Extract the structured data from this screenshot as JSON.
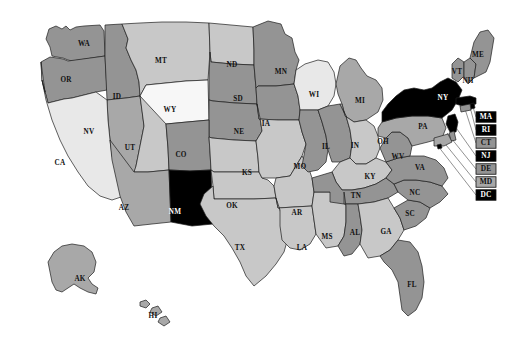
{
  "map": {
    "title": "United States choropleth map",
    "projection_note": "Albers-style USA with Alaska and Hawaii insets",
    "background_color": "#ffffff",
    "border_color": "#1c1c1c",
    "shades": {
      "level_0": "#f7f7f7",
      "level_1": "#e8e8e8",
      "level_2": "#d0d0d0",
      "level_3": "#c8c8c8",
      "level_4": "#a8a8a8",
      "level_5": "#949494",
      "level_6": "#000000"
    },
    "states": [
      {
        "code": "WA",
        "shade": "#949494",
        "label_x": 84,
        "label_y": 44,
        "dark_text": false
      },
      {
        "code": "OR",
        "shade": "#949494",
        "label_x": 66,
        "label_y": 80,
        "dark_text": false
      },
      {
        "code": "ID",
        "shade": "#949494",
        "label_x": 117,
        "label_y": 97,
        "dark_text": false
      },
      {
        "code": "MT",
        "shade": "#c8c8c8",
        "label_x": 161,
        "label_y": 61,
        "dark_text": false
      },
      {
        "code": "WY",
        "shade": "#f7f7f7",
        "label_x": 170,
        "label_y": 110,
        "dark_text": false
      },
      {
        "code": "ND",
        "shade": "#c8c8c8",
        "label_x": 232,
        "label_y": 65,
        "dark_text": false
      },
      {
        "code": "SD",
        "shade": "#949494",
        "label_x": 238,
        "label_y": 99,
        "dark_text": false
      },
      {
        "code": "NE",
        "shade": "#949494",
        "label_x": 239,
        "label_y": 132,
        "dark_text": false
      },
      {
        "code": "MN",
        "shade": "#949494",
        "label_x": 281,
        "label_y": 72,
        "dark_text": false
      },
      {
        "code": "IA",
        "shade": "#949494",
        "label_x": 266,
        "label_y": 124,
        "dark_text": false
      },
      {
        "code": "WI",
        "shade": "#e8e8e8",
        "label_x": 314,
        "label_y": 95,
        "dark_text": false
      },
      {
        "code": "MI",
        "shade": "#a8a8a8",
        "label_x": 360,
        "label_y": 101,
        "dark_text": false
      },
      {
        "code": "NV",
        "shade": "#a8a8a8",
        "label_x": 89,
        "label_y": 132,
        "dark_text": false
      },
      {
        "code": "UT",
        "shade": "#c8c8c8",
        "label_x": 130,
        "label_y": 148,
        "dark_text": false
      },
      {
        "code": "CO",
        "shade": "#949494",
        "label_x": 181,
        "label_y": 155,
        "dark_text": false
      },
      {
        "code": "CA",
        "shade": "#e8e8e8",
        "label_x": 60,
        "label_y": 163,
        "dark_text": false
      },
      {
        "code": "AZ",
        "shade": "#a8a8a8",
        "label_x": 124,
        "label_y": 208,
        "dark_text": false
      },
      {
        "code": "NM",
        "shade": "#000000",
        "label_x": 175,
        "label_y": 212,
        "dark_text": true
      },
      {
        "code": "KS",
        "shade": "#c8c8c8",
        "label_x": 247,
        "label_y": 173,
        "dark_text": false
      },
      {
        "code": "OK",
        "shade": "#c8c8c8",
        "label_x": 232,
        "label_y": 206,
        "dark_text": false
      },
      {
        "code": "TX",
        "shade": "#c8c8c8",
        "label_x": 240,
        "label_y": 248,
        "dark_text": false
      },
      {
        "code": "MO",
        "shade": "#c8c8c8",
        "label_x": 300,
        "label_y": 167,
        "dark_text": false
      },
      {
        "code": "AR",
        "shade": "#c8c8c8",
        "label_x": 297,
        "label_y": 213,
        "dark_text": false
      },
      {
        "code": "LA",
        "shade": "#c8c8c8",
        "label_x": 302,
        "label_y": 248,
        "dark_text": false
      },
      {
        "code": "MS",
        "shade": "#c8c8c8",
        "label_x": 327,
        "label_y": 237,
        "dark_text": false
      },
      {
        "code": "IL",
        "shade": "#949494",
        "label_x": 326,
        "label_y": 147,
        "dark_text": false
      },
      {
        "code": "IN",
        "shade": "#949494",
        "label_x": 355,
        "label_y": 146,
        "dark_text": false
      },
      {
        "code": "OH",
        "shade": "#c8c8c8",
        "label_x": 383,
        "label_y": 142,
        "dark_text": false
      },
      {
        "code": "KY",
        "shade": "#c8c8c8",
        "label_x": 370,
        "label_y": 177,
        "dark_text": false
      },
      {
        "code": "TN",
        "shade": "#949494",
        "label_x": 356,
        "label_y": 196,
        "dark_text": false
      },
      {
        "code": "AL",
        "shade": "#949494",
        "label_x": 355,
        "label_y": 233,
        "dark_text": false
      },
      {
        "code": "GA",
        "shade": "#c8c8c8",
        "label_x": 386,
        "label_y": 232,
        "dark_text": false
      },
      {
        "code": "FL",
        "shade": "#949494",
        "label_x": 412,
        "label_y": 285,
        "dark_text": false
      },
      {
        "code": "SC",
        "shade": "#949494",
        "label_x": 410,
        "label_y": 214,
        "dark_text": false
      },
      {
        "code": "NC",
        "shade": "#949494",
        "label_x": 415,
        "label_y": 193,
        "dark_text": false
      },
      {
        "code": "VA",
        "shade": "#949494",
        "label_x": 420,
        "label_y": 168,
        "dark_text": false
      },
      {
        "code": "WV",
        "shade": "#949494",
        "label_x": 398,
        "label_y": 157,
        "dark_text": false
      },
      {
        "code": "PA",
        "shade": "#a8a8a8",
        "label_x": 423,
        "label_y": 127,
        "dark_text": false
      },
      {
        "code": "NY",
        "shade": "#000000",
        "label_x": 443,
        "label_y": 98,
        "dark_text": true
      },
      {
        "code": "VT",
        "shade": "#949494",
        "label_x": 457,
        "label_y": 72,
        "dark_text": false
      },
      {
        "code": "NH",
        "shade": "#949494",
        "label_x": 468,
        "label_y": 81,
        "dark_text": false
      },
      {
        "code": "ME",
        "shade": "#949494",
        "label_x": 478,
        "label_y": 55,
        "dark_text": false
      },
      {
        "code": "AK",
        "shade": "#a8a8a8",
        "label_x": 80,
        "label_y": 279,
        "dark_text": false
      },
      {
        "code": "HI",
        "shade": "#a8a8a8",
        "label_x": 153,
        "label_y": 316,
        "dark_text": false
      }
    ],
    "callouts": [
      {
        "code": "MA",
        "shade": "#000000",
        "text_light": true,
        "box_x": 486,
        "box_y": 117,
        "tip_x": 470,
        "tip_y": 97
      },
      {
        "code": "RI",
        "shade": "#000000",
        "text_light": true,
        "box_x": 486,
        "box_y": 130,
        "tip_x": 469,
        "tip_y": 103
      },
      {
        "code": "CT",
        "shade": "#949494",
        "text_light": false,
        "box_x": 486,
        "box_y": 143,
        "tip_x": 464,
        "tip_y": 106
      },
      {
        "code": "NJ",
        "shade": "#000000",
        "text_light": true,
        "box_x": 486,
        "box_y": 156,
        "tip_x": 452,
        "tip_y": 122
      },
      {
        "code": "DE",
        "shade": "#949494",
        "text_light": false,
        "box_x": 486,
        "box_y": 169,
        "tip_x": 447,
        "tip_y": 133
      },
      {
        "code": "MD",
        "shade": "#a8a8a8",
        "text_light": false,
        "box_x": 486,
        "box_y": 182,
        "tip_x": 442,
        "tip_y": 140
      },
      {
        "code": "DC",
        "shade": "#000000",
        "text_light": true,
        "box_x": 486,
        "box_y": 195,
        "tip_x": 438,
        "tip_y": 146
      }
    ]
  },
  "chart_data": {
    "type": "heatmap",
    "xlabel": "",
    "ylabel": "",
    "legend_position": "none",
    "grid": false,
    "categories": [
      "WA",
      "OR",
      "ID",
      "MT",
      "WY",
      "ND",
      "SD",
      "NE",
      "MN",
      "IA",
      "WI",
      "MI",
      "NV",
      "UT",
      "CO",
      "CA",
      "AZ",
      "NM",
      "KS",
      "OK",
      "TX",
      "MO",
      "AR",
      "LA",
      "MS",
      "IL",
      "IN",
      "OH",
      "KY",
      "TN",
      "AL",
      "GA",
      "FL",
      "SC",
      "NC",
      "VA",
      "WV",
      "PA",
      "NY",
      "VT",
      "NH",
      "ME",
      "AK",
      "HI",
      "MA",
      "RI",
      "CT",
      "NJ",
      "DE",
      "MD",
      "DC"
    ],
    "values": [
      "#949494",
      "#949494",
      "#949494",
      "#c8c8c8",
      "#f7f7f7",
      "#c8c8c8",
      "#949494",
      "#949494",
      "#949494",
      "#949494",
      "#e8e8e8",
      "#a8a8a8",
      "#a8a8a8",
      "#c8c8c8",
      "#949494",
      "#e8e8e8",
      "#a8a8a8",
      "#000000",
      "#c8c8c8",
      "#c8c8c8",
      "#c8c8c8",
      "#c8c8c8",
      "#c8c8c8",
      "#c8c8c8",
      "#c8c8c8",
      "#949494",
      "#949494",
      "#c8c8c8",
      "#c8c8c8",
      "#949494",
      "#949494",
      "#c8c8c8",
      "#949494",
      "#949494",
      "#949494",
      "#949494",
      "#949494",
      "#a8a8a8",
      "#000000",
      "#949494",
      "#949494",
      "#949494",
      "#a8a8a8",
      "#a8a8a8",
      "#000000",
      "#000000",
      "#949494",
      "#000000",
      "#949494",
      "#a8a8a8",
      "#000000"
    ],
    "annotations": [
      "Darkest shade (black) marks NY, NM, MA, RI, NJ, DC",
      "Lightest shade marks WY",
      "Callout boxes on right edge label the small northeastern states"
    ]
  }
}
